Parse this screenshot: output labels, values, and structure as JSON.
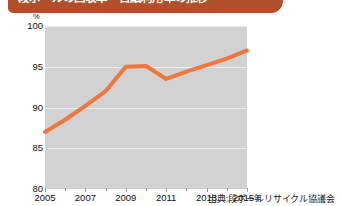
{
  "banner": {
    "title": "段ボールの回収率・古紙利用率の推移"
  },
  "source": {
    "label": "出典:段ボールリサイクル協議会"
  },
  "chart_data": {
    "type": "line",
    "title": "段ボールの回収率・古紙利用率の推移",
    "xlabel": "年",
    "ylabel": "%",
    "unit_label": "%",
    "x": [
      2005,
      2006,
      2007,
      2008,
      2009,
      2010,
      2011,
      2012,
      2013,
      2014,
      2015
    ],
    "series": [
      {
        "name": "回収率",
        "color": "#f0783c",
        "values": [
          87.0,
          88.5,
          90.2,
          92.0,
          95.0,
          95.1,
          93.5,
          94.4,
          95.2,
          96.0,
          97.0
        ]
      }
    ],
    "xlim": [
      2005,
      2015
    ],
    "ylim": [
      80,
      100
    ],
    "yticks": [
      100,
      95,
      90,
      85,
      80
    ],
    "xticks": [
      2005,
      2007,
      2009,
      2011,
      2013,
      2015
    ],
    "xtick_labels": [
      "2005",
      "2007",
      "2009",
      "2011",
      "2013",
      "2015"
    ],
    "xtick_last_suffix": "年",
    "grid": true,
    "legend": "none",
    "plot_background": "#d2d2d2",
    "gridline_color": "#efefef"
  }
}
